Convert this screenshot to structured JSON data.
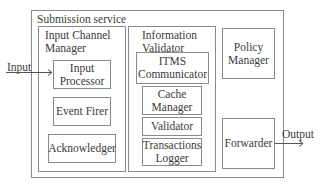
{
  "diagram": {
    "outer": {
      "label": "Submission service"
    },
    "input_channel_manager": {
      "label_line1": "Input Channel",
      "label_line2": "Manager",
      "components": [
        {
          "line1": "Input",
          "line2": "Processor"
        },
        {
          "line1": "Event Firer"
        },
        {
          "line1": "Acknowledger"
        }
      ]
    },
    "information_validator": {
      "label_line1": "Information",
      "label_line2": "Validator",
      "components": [
        {
          "line1": "ITMS",
          "line2": "Communicator"
        },
        {
          "line1": "Cache",
          "line2": "Manager"
        },
        {
          "line1": "Validator"
        },
        {
          "line1": "Transactions",
          "line2": "Logger"
        }
      ]
    },
    "policy_manager": {
      "line1": "Policy",
      "line2": "Manager"
    },
    "forwarder": {
      "line1": "Forwarder"
    },
    "input_label": "Input",
    "output_label": "Output",
    "colors": {
      "stroke": "#8a8a8a",
      "text": "#3a3a3a",
      "background": "#ffffff"
    }
  }
}
